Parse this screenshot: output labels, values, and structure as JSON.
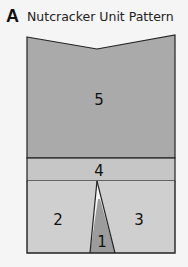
{
  "figure": {
    "letter": "A",
    "title": "Nutcracker Unit Pattern"
  },
  "pieces": [
    {
      "id": "1",
      "label": "1",
      "color": "#9c9c9c"
    },
    {
      "id": "2",
      "label": "2",
      "color": "#cfcfcf"
    },
    {
      "id": "3",
      "label": "3",
      "color": "#cfcfcf"
    },
    {
      "id": "4",
      "label": "4",
      "color": "#c6c6c6"
    },
    {
      "id": "5",
      "label": "5",
      "color": "#aaaaaa"
    }
  ],
  "colors": {
    "background": "#f5f5f5",
    "outline": "#222222"
  }
}
